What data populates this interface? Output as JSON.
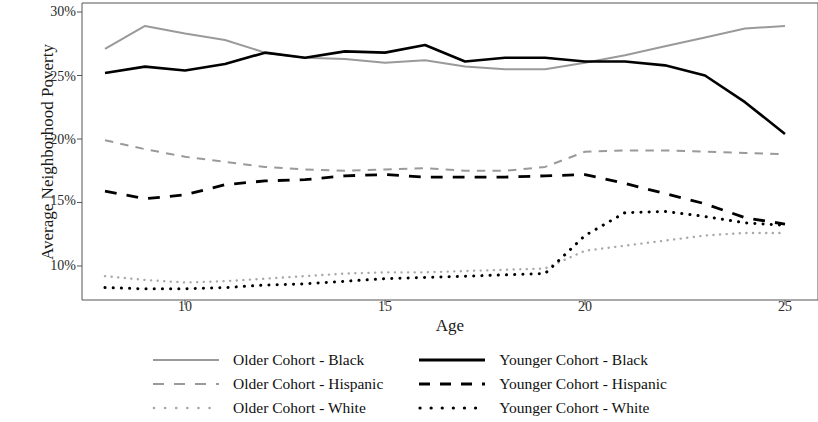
{
  "chart_data": {
    "type": "line",
    "title": "",
    "xlabel": "Age",
    "ylabel": "Average Neighborhood Poverty",
    "xlim": [
      7.4,
      25.6
    ],
    "ylim": [
      7.2,
      30.4
    ],
    "xticks": [
      10,
      15,
      20,
      25
    ],
    "xtick_labels": [
      "10",
      "15",
      "20",
      "25"
    ],
    "yticks": [
      10,
      15,
      20,
      25,
      30
    ],
    "ytick_labels": [
      "10%",
      "15%",
      "20%",
      "25%",
      "30%"
    ],
    "grid": false,
    "legend_position": "bottom",
    "x": [
      8,
      9,
      10,
      11,
      12,
      13,
      14,
      15,
      16,
      17,
      18,
      19,
      20,
      21,
      22,
      23,
      24,
      25
    ],
    "series": [
      {
        "name": "Older Cohort - Black",
        "style": "solid",
        "color": "#9a9a9a",
        "width": 2.0,
        "values": [
          27.1,
          28.9,
          28.3,
          27.8,
          26.8,
          26.4,
          26.3,
          26.0,
          26.2,
          25.7,
          25.5,
          25.5,
          26.0,
          26.6,
          27.3,
          28.0,
          28.7,
          28.9
        ]
      },
      {
        "name": "Younger Cohort - Black",
        "style": "solid",
        "color": "#000000",
        "width": 2.6,
        "values": [
          25.2,
          25.7,
          25.4,
          25.9,
          26.8,
          26.4,
          26.9,
          26.8,
          27.4,
          26.1,
          26.4,
          26.4,
          26.1,
          26.1,
          25.8,
          25.0,
          22.9,
          20.4
        ]
      },
      {
        "name": "Older Cohort - Hispanic",
        "style": "dashed",
        "color": "#9a9a9a",
        "width": 2.0,
        "values": [
          19.9,
          19.2,
          18.6,
          18.2,
          17.8,
          17.6,
          17.5,
          17.6,
          17.7,
          17.5,
          17.5,
          17.8,
          19.0,
          19.1,
          19.1,
          19.0,
          18.9,
          18.8
        ]
      },
      {
        "name": "Younger Cohort - Hispanic",
        "style": "dashed",
        "color": "#000000",
        "width": 2.8,
        "values": [
          15.9,
          15.3,
          15.6,
          16.4,
          16.7,
          16.8,
          17.1,
          17.2,
          17.0,
          17.0,
          17.0,
          17.1,
          17.2,
          16.5,
          15.7,
          14.9,
          13.8,
          13.3
        ]
      },
      {
        "name": "Older Cohort - White",
        "style": "dotted",
        "color": "#a8a8a8",
        "width": 2.4,
        "values": [
          9.2,
          8.9,
          8.7,
          8.8,
          9.0,
          9.2,
          9.4,
          9.5,
          9.5,
          9.6,
          9.7,
          9.8,
          11.2,
          11.6,
          12.0,
          12.4,
          12.6,
          12.6
        ]
      },
      {
        "name": "Younger Cohort - White",
        "style": "dotted",
        "color": "#000000",
        "width": 3.0,
        "values": [
          8.3,
          8.2,
          8.2,
          8.3,
          8.5,
          8.6,
          8.8,
          9.0,
          9.1,
          9.2,
          9.3,
          9.4,
          12.4,
          14.2,
          14.3,
          13.9,
          13.4,
          13.2
        ]
      }
    ]
  },
  "axis": {
    "ylabel": "Average Neighborhood Poverty",
    "xlabel": "Age",
    "ytick_labels": [
      "30%",
      "25%",
      "20%",
      "15%",
      "10%"
    ],
    "xtick_labels": [
      "10",
      "15",
      "20",
      "25"
    ]
  },
  "legend": {
    "rows": [
      {
        "left_label": "Older Cohort - Black",
        "right_label": "Younger Cohort - Black"
      },
      {
        "left_label": "Older Cohort - Hispanic",
        "right_label": "Younger Cohort - Hispanic"
      },
      {
        "left_label": "Older Cohort - White",
        "right_label": "Younger Cohort - White"
      }
    ]
  }
}
